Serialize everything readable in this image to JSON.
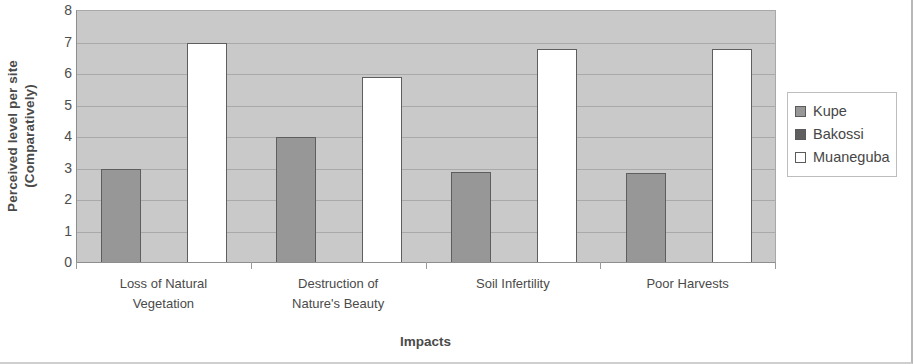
{
  "chart_data": {
    "type": "bar",
    "title": "",
    "xlabel": "Impacts",
    "ylabel": "Perceived level per site (Comparatively)",
    "ylabel_line1": "Perceived level per site",
    "ylabel_line2": "(Comparatively)",
    "categories": [
      "Loss of Natural Vegetation",
      "Destruction of Nature's Beauty",
      "Soil Infertility",
      "Poor Harvests"
    ],
    "category_lines": [
      [
        "Loss of Natural",
        "Vegetation"
      ],
      [
        "Destruction of",
        "Nature's Beauty"
      ],
      [
        "Soil Infertility",
        ""
      ],
      [
        "Poor Harvests",
        ""
      ]
    ],
    "series": [
      {
        "name": "Kupe",
        "color": "#979797",
        "values": [
          3.0,
          4.0,
          2.9,
          2.85
        ]
      },
      {
        "name": "Bakossi",
        "color": "#5f5f5f",
        "values": [
          null,
          null,
          null,
          null
        ]
      },
      {
        "name": "Muaneguba",
        "color": "#ffffff",
        "values": [
          7.0,
          5.9,
          6.8,
          6.8
        ]
      }
    ],
    "ylim": [
      0,
      8
    ],
    "yticks": [
      0,
      1,
      2,
      3,
      4,
      5,
      6,
      7,
      8
    ],
    "ytick_labels": [
      "0",
      "1",
      "2",
      "3",
      "4",
      "5",
      "6",
      "7",
      "8"
    ],
    "grid": true,
    "legend_position": "right",
    "plot_background": "#c9c9c9",
    "gridline_color": "#a9a9a9",
    "bar_border_color": "#5e5e5e"
  },
  "legend": {
    "items": [
      {
        "label": "Kupe",
        "swatch": "legend-swatch-kupe"
      },
      {
        "label": "Bakossi",
        "swatch": "legend-swatch-bakossi"
      },
      {
        "label": "Muaneguba",
        "swatch": "legend-swatch-muaneguba"
      }
    ]
  }
}
